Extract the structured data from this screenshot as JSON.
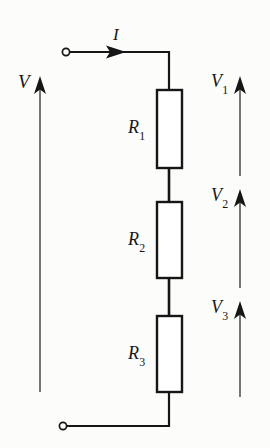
{
  "figure": {
    "kind": "circuit-diagram",
    "background_color": "#fcfcfb",
    "line_color": "#161616"
  },
  "labels": {
    "source_voltage": {
      "symbol": "V",
      "subscript": ""
    },
    "current": {
      "symbol": "I",
      "subscript": ""
    },
    "resistor_1": {
      "symbol": "R",
      "subscript": "1"
    },
    "resistor_2": {
      "symbol": "R",
      "subscript": "2"
    },
    "resistor_3": {
      "symbol": "R",
      "subscript": "3"
    },
    "voltage_1": {
      "symbol": "V",
      "subscript": "1"
    },
    "voltage_2": {
      "symbol": "V",
      "subscript": "2"
    },
    "voltage_3": {
      "symbol": "V",
      "subscript": "3"
    }
  },
  "components": {
    "terminals": [
      {
        "name": "top-terminal",
        "cx": 66,
        "cy": 52,
        "r": 3.6
      },
      {
        "name": "bottom-terminal",
        "cx": 63,
        "cy": 426,
        "r": 3.6
      }
    ],
    "resistors": [
      {
        "name": "R1",
        "x": 157,
        "y": 90,
        "width": 25,
        "height": 78
      },
      {
        "name": "R2",
        "x": 157,
        "y": 202,
        "width": 25,
        "height": 76
      },
      {
        "name": "R3",
        "x": 157,
        "y": 316,
        "width": 25,
        "height": 76
      }
    ],
    "arrows": [
      {
        "name": "V-arrow",
        "x": 40,
        "y_tail": 392,
        "y_tip": 78,
        "direction": "up"
      },
      {
        "name": "V1-arrow",
        "x": 240,
        "y_tail": 176,
        "y_tip": 78,
        "direction": "up"
      },
      {
        "name": "V2-arrow",
        "x": 240,
        "y_tail": 288,
        "y_tip": 191,
        "direction": "up"
      },
      {
        "name": "V3-arrow",
        "x": 240,
        "y_tail": 397,
        "y_tip": 303,
        "direction": "up"
      },
      {
        "name": "I-arrow",
        "y": 52,
        "x_tail": 69,
        "x_tip": 126,
        "direction": "right"
      }
    ]
  }
}
